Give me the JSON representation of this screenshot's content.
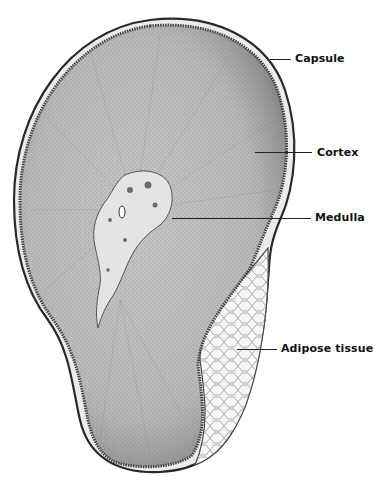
{
  "figure": {
    "labels": [
      {
        "id": "capsule",
        "text": "Capsule",
        "x": 295,
        "y": 52,
        "line_x1": 270,
        "line_x2": 291,
        "line_y": 59
      },
      {
        "id": "cortex",
        "text": "Cortex",
        "x": 317,
        "y": 146,
        "line_x1": 255,
        "line_x2": 312,
        "line_y": 152
      },
      {
        "id": "medulla",
        "text": "Medulla",
        "x": 315,
        "y": 211,
        "line_x1": 172,
        "line_x2": 311,
        "line_y": 218
      },
      {
        "id": "adipose",
        "text": "Adipose tissue",
        "x": 281,
        "y": 342,
        "line_x1": 237,
        "line_x2": 277,
        "line_y": 349
      }
    ]
  },
  "colors": {
    "background": "#ffffff",
    "cortex_fill": "#bdbdbd",
    "cortex_dark": "#6e6e6e",
    "capsule_line": "#2a2a2a",
    "medulla_fill": "#e6e6e6",
    "adipose_fill": "#f4f4f4",
    "text": "#111111"
  }
}
